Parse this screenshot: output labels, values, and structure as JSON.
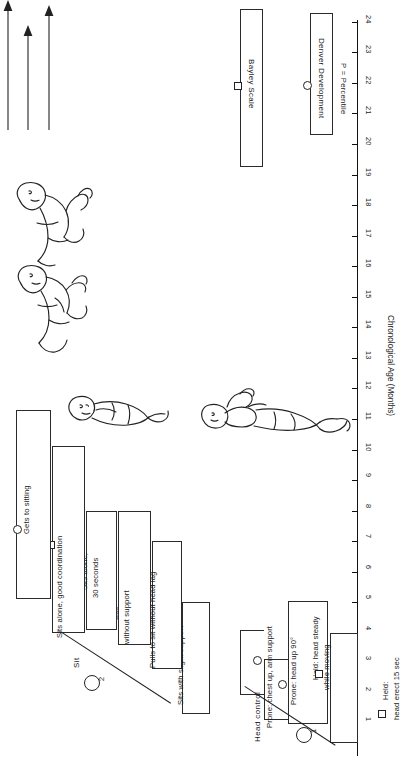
{
  "chart_data": {
    "type": "bar",
    "orientation": "horizontal-rotated",
    "xlabel": "Chronological Age (Months)",
    "ylabel": "",
    "xlim": [
      0,
      24
    ],
    "grid": false,
    "tick_labels": [
      "1",
      "2",
      "3",
      "4",
      "5",
      "6",
      "7",
      "8",
      "9",
      "10",
      "11",
      "12",
      "13",
      "14",
      "15",
      "16",
      "17",
      "18",
      "19",
      "20",
      "21",
      "22",
      "23",
      "24"
    ],
    "legend_position": "top-right",
    "legend": [
      {
        "label": "Bayley Scale",
        "marker": "square"
      },
      {
        "label": "Denver Development",
        "marker": "circle"
      }
    ],
    "note": "P = Percentile",
    "sections": [
      {
        "number": "1",
        "name": "Head control",
        "items": [
          {
            "label": "Held:\nhead erect 15 sec",
            "start": 0.4,
            "end": 4.0,
            "marker": "square",
            "marker_at": 1.55,
            "style": "box"
          },
          {
            "label": "Held: head steady\nwhile moving",
            "start": 1.0,
            "end": 5.05,
            "marker": "square",
            "marker_at": 2.85,
            "style": "box"
          },
          {
            "label": "Prone: head up 90°",
            "start": 1.15,
            "end": 3.15,
            "marker": "circle",
            "marker_at": 2.25,
            "style": "bracket"
          },
          {
            "label": "Prone: chest up, arm support",
            "start": 1.95,
            "end": 4.1,
            "marker": "circle",
            "marker_at": 3.05,
            "style": "bracket"
          }
        ]
      },
      {
        "number": "2",
        "name": "Sit",
        "items": [
          {
            "label": "Sits with slight support",
            "start": 1.35,
            "end": 5.0,
            "marker": "square",
            "marker_at": 3.35,
            "style": "box"
          },
          {
            "label": "Pulls to sit without head lag",
            "start": 2.8,
            "end": 7.0,
            "marker": "circle",
            "marker_at": 4.7,
            "style": "box"
          },
          {
            "label": "Sits\nwithout support",
            "start": 3.6,
            "end": 8.0,
            "marker": "circle",
            "marker_at": 5.8,
            "style": "box"
          },
          {
            "label": "Sits alone,\n30 seconds",
            "start": 4.1,
            "end": 8.0,
            "marker": "square",
            "marker_at": 6.2,
            "style": "box"
          },
          {
            "label": "Sits alone, good coordination",
            "start": 4.0,
            "end": 10.1,
            "marker": "square",
            "marker_at": 7.1,
            "style": "box"
          },
          {
            "label": "Gets to sitting",
            "start": 5.1,
            "end": 11.3,
            "marker": "circle",
            "marker_at": 7.6,
            "style": "box"
          }
        ]
      }
    ]
  },
  "axis": {
    "title": "Chronological Age (Months)",
    "ticks": [
      "1",
      "2",
      "3",
      "4",
      "5",
      "6",
      "7",
      "8",
      "9",
      "10",
      "11",
      "12",
      "13",
      "14",
      "15",
      "16",
      "17",
      "18",
      "19",
      "20",
      "21",
      "22",
      "23",
      "24"
    ]
  },
  "legend": {
    "bayley_label": "Bayley Scale",
    "denver_label": "Denver Development",
    "percentile_note": "P = Percentile"
  },
  "sections": {
    "head_control": {
      "title": "Head control",
      "number": "1"
    },
    "sit": {
      "title": "Sit",
      "number": "2"
    }
  },
  "bars": {
    "head_erect": "Held:",
    "head_erect2": "head erect 15 sec",
    "head_steady": "Held: head steady",
    "head_steady2": "while moving",
    "prone_head90": "Prone: head up 90°",
    "prone_chest": "Prone: chest up, arm support",
    "sits_slight": "Sits with slight support",
    "pulls_to_sit": "Pulls to sit without head lag",
    "sits_without": "Sits",
    "sits_without2": "without support",
    "sits_alone30": "Sits alone,",
    "sits_alone30b": "30 seconds",
    "sits_alone_coord": "Sits alone, good coordination",
    "gets_to_sitting": "Gets to sitting"
  },
  "figures": {
    "infant_head_control": "infant-held-upright-illustration",
    "infant_sitting_a": "infant-sitting-illustration-a",
    "infant_sitting_b": "infant-sitting-illustration-b",
    "infant_sitting_c": "infant-sitting-illustration-c"
  }
}
